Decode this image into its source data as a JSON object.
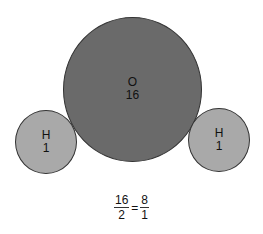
{
  "diagram": {
    "oxygen": {
      "symbol": "O",
      "mass": "16",
      "color": "#6a6a6a"
    },
    "hydrogen_left": {
      "symbol": "H",
      "mass": "1",
      "color": "#a9a9a9"
    },
    "hydrogen_right": {
      "symbol": "H",
      "mass": "1",
      "color": "#a9a9a9"
    },
    "equation": {
      "left_num": "16",
      "left_den": "2",
      "equals": "=",
      "right_num": "8",
      "right_den": "1"
    }
  }
}
